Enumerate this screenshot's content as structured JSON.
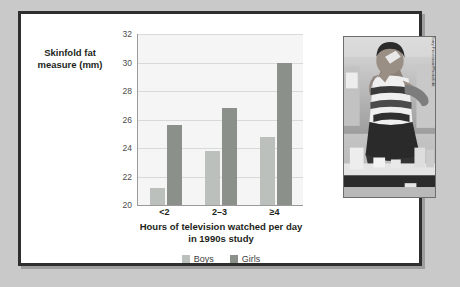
{
  "figure": {
    "y_axis_title": "Skinfold fat measure (mm)",
    "x_axis_title_line1": "Hours of television watched per day",
    "x_axis_title_line2": "in 1990s study"
  },
  "photo": {
    "credit": "Tony Freeman/PhotoEdit",
    "alt_name": "boy-eating-junk-food-photo"
  },
  "colors": {
    "boys": "#bcc0bc",
    "girls": "#8b908b",
    "plot_background": "#f4f5f4",
    "gridline": "#d8dad8",
    "frame_border": "#2e2e2e",
    "page_background": "#c9c9c9"
  },
  "chart_data": {
    "type": "bar",
    "title": "",
    "xlabel": "Hours of television watched per day in 1990s study",
    "ylabel": "Skinfold fat measure (mm)",
    "categories": [
      "<2",
      "2–3",
      "≥4"
    ],
    "series": [
      {
        "name": "Boys",
        "values": [
          21.2,
          23.8,
          24.8
        ]
      },
      {
        "name": "Girls",
        "values": [
          25.6,
          26.8,
          30.0
        ]
      }
    ],
    "ylim": [
      20,
      32
    ],
    "yticks": [
      20,
      22,
      24,
      26,
      28,
      30,
      32
    ],
    "ytick_labels": [
      "20",
      "22",
      "24",
      "26",
      "28",
      "30",
      "32"
    ],
    "grid": true,
    "legend": [
      "Boys",
      "Girls"
    ],
    "legend_position": "bottom"
  }
}
